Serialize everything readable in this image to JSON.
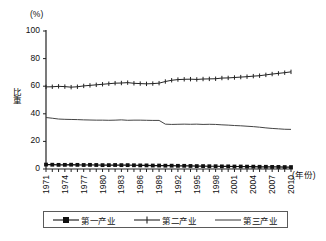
{
  "chart_data": {
    "type": "line",
    "title": "",
    "xlabel": "(年份)",
    "ylabel": "比重",
    "yunit": "(%)",
    "xlim": [
      1971,
      2010
    ],
    "ylim": [
      0,
      100
    ],
    "grid": false,
    "legend_position": "bottom",
    "yticks": [
      "100",
      "80",
      "60",
      "40",
      "20",
      "0"
    ],
    "ytick_values": [
      100,
      80,
      60,
      40,
      20,
      0
    ],
    "xticks": [
      "1971",
      "1974",
      "1977",
      "1980",
      "1983",
      "1986",
      "1989",
      "1992",
      "1995",
      "1998",
      "2001",
      "2004",
      "2007",
      "2010"
    ],
    "xtick_values": [
      1971,
      1974,
      1977,
      1980,
      1983,
      1986,
      1989,
      1992,
      1995,
      1998,
      2001,
      2004,
      2007,
      2010
    ],
    "x": [
      1971,
      1972,
      1973,
      1974,
      1975,
      1976,
      1977,
      1978,
      1979,
      1980,
      1981,
      1982,
      1983,
      1984,
      1985,
      1986,
      1987,
      1988,
      1989,
      1990,
      1991,
      1992,
      1993,
      1994,
      1995,
      1996,
      1997,
      1998,
      1999,
      2000,
      2001,
      2002,
      2003,
      2004,
      2005,
      2006,
      2007,
      2008,
      2009,
      2010
    ],
    "series": [
      {
        "name": "第一产业",
        "marker": "square",
        "values": [
          3.2,
          3.1,
          3.0,
          3.0,
          3.1,
          3.0,
          2.9,
          3.0,
          2.9,
          2.8,
          2.8,
          2.9,
          2.8,
          2.8,
          2.7,
          2.6,
          2.6,
          2.5,
          2.5,
          2.4,
          2.4,
          2.3,
          2.3,
          2.2,
          2.1,
          2.1,
          2.0,
          2.0,
          1.9,
          1.9,
          1.8,
          1.8,
          1.7,
          1.7,
          1.6,
          1.6,
          1.5,
          1.5,
          1.4,
          1.4
        ]
      },
      {
        "name": "第二产业",
        "marker": "plus",
        "values": [
          59.5,
          59.6,
          59.9,
          59.7,
          59.3,
          59.6,
          60.2,
          60.6,
          61.0,
          61.4,
          61.8,
          62.2,
          62.3,
          62.6,
          62.1,
          61.9,
          61.7,
          61.9,
          62.2,
          63.4,
          64.3,
          64.8,
          65.0,
          65.1,
          64.9,
          65.2,
          65.3,
          65.4,
          65.9,
          66.0,
          66.3,
          66.6,
          66.9,
          67.3,
          67.6,
          68.2,
          68.8,
          69.3,
          69.8,
          70.4
        ]
      },
      {
        "name": "第三产业",
        "marker": "none",
        "values": [
          37.3,
          36.8,
          36.2,
          36.0,
          35.9,
          35.8,
          35.6,
          35.5,
          35.4,
          35.4,
          35.3,
          35.4,
          35.6,
          35.3,
          35.4,
          35.4,
          35.3,
          35.2,
          35.2,
          32.5,
          32.3,
          32.4,
          32.5,
          32.4,
          32.5,
          32.3,
          32.4,
          32.3,
          32.0,
          31.8,
          31.5,
          31.3,
          31.0,
          30.7,
          30.3,
          29.8,
          29.4,
          29.1,
          28.8,
          28.7
        ]
      }
    ]
  },
  "legend": {
    "items": [
      {
        "label": "第一产业"
      },
      {
        "label": "第二产业"
      },
      {
        "label": "第三产业"
      }
    ]
  },
  "colors": {
    "axis": "#222222",
    "series1": "#111111",
    "series2": "#222222",
    "series3": "#444444",
    "legend_border": "#5a5a5a",
    "background": "#ffffff"
  }
}
